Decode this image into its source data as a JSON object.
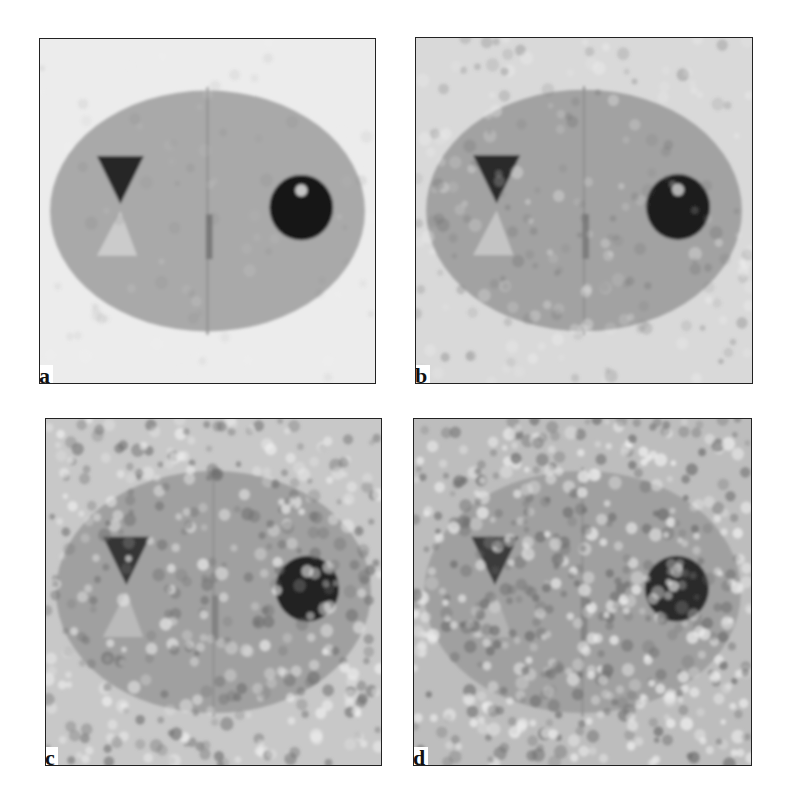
{
  "figure": {
    "panels": [
      {
        "id": "a",
        "label": "a",
        "noise": 0.06,
        "blur": 1.2,
        "bg": "#ececec",
        "ellipse": "#a9a9a9",
        "x": 39,
        "y": 38,
        "w": 337,
        "h": 346
      },
      {
        "id": "b",
        "label": "b",
        "noise": 0.16,
        "blur": 1.5,
        "bg": "#d9d9d9",
        "ellipse": "#a2a2a2",
        "x": 415,
        "y": 37,
        "w": 338,
        "h": 347
      },
      {
        "id": "c",
        "label": "c",
        "noise": 0.3,
        "blur": 1.6,
        "bg": "#c8c8c8",
        "ellipse": "#a0a0a0",
        "x": 45,
        "y": 418,
        "w": 337,
        "h": 348
      },
      {
        "id": "d",
        "label": "d",
        "noise": 0.4,
        "blur": 1.6,
        "bg": "#bdbdbd",
        "ellipse": "#a0a0a0",
        "x": 413,
        "y": 418,
        "w": 339,
        "h": 348
      }
    ],
    "phantom": {
      "ellipse": {
        "cx": 0.5,
        "cy": 0.5,
        "rx": 0.47,
        "ry": 0.35
      },
      "dark_triangle": {
        "points": "0.17,0.34 0.31,0.34 0.24,0.48",
        "color": "#1a1a1a"
      },
      "light_triangle": {
        "points": "0.17,0.63 0.29,0.63 0.24,0.50",
        "color": "#cfcfcf"
      },
      "center_line": {
        "x": 0.5,
        "y1": 0.14,
        "y2": 0.86,
        "color": "#8f8f8f"
      },
      "center_bar": {
        "x": 0.495,
        "y1": 0.51,
        "y2": 0.64,
        "w": 0.02,
        "color": "#777777"
      },
      "circle": {
        "cx": 0.78,
        "cy": 0.49,
        "r": 0.095,
        "color": "#0d0d0d"
      },
      "hot_spot": {
        "cx": 0.78,
        "cy": 0.44,
        "r": 0.018,
        "color": "#d0d0d0"
      }
    }
  }
}
